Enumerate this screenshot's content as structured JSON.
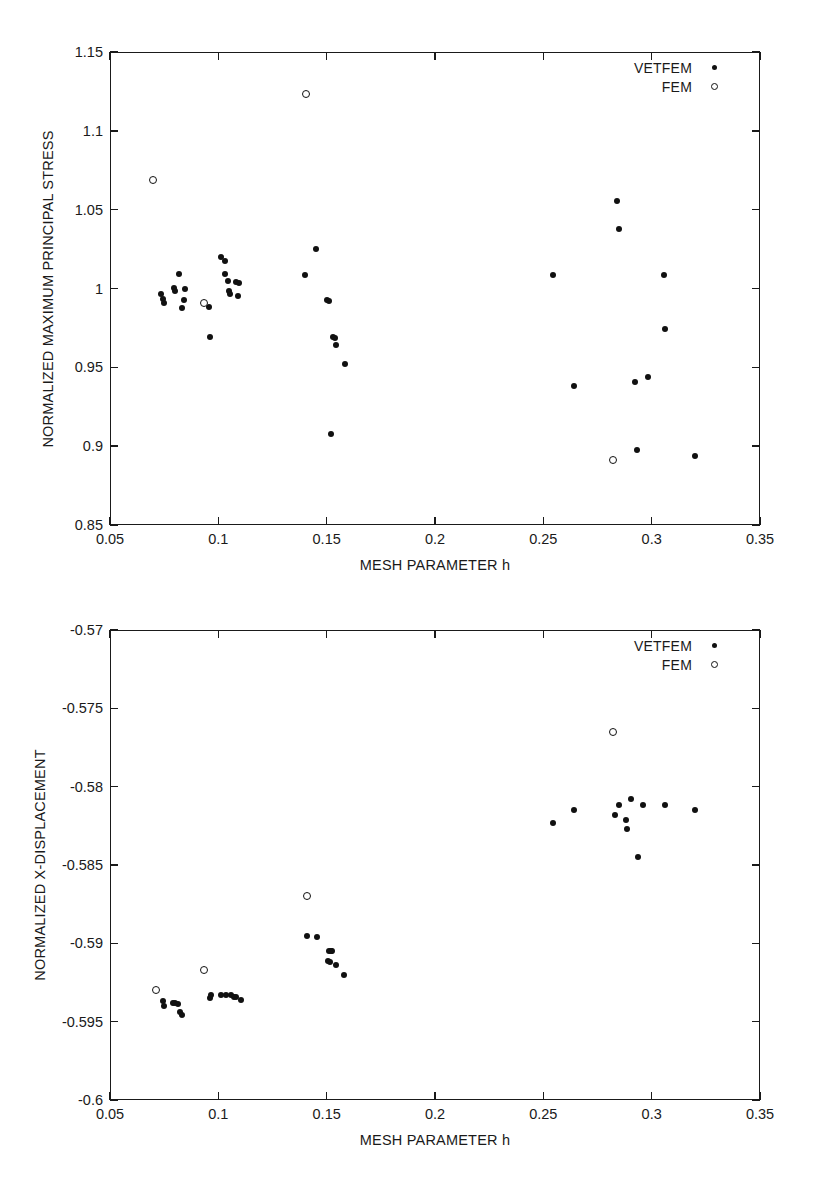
{
  "page": {
    "background": "#ffffff",
    "ink": "#111111"
  },
  "chart_data": [
    {
      "id": "stress",
      "type": "scatter",
      "title": "",
      "xlabel": "MESH PARAMETER h",
      "ylabel": "NORMALIZED MAXIMUM PRINCIPAL STRESS",
      "xlim": [
        0.05,
        0.35
      ],
      "ylim": [
        0.85,
        1.15
      ],
      "xticks": [
        0.05,
        0.1,
        0.15,
        0.2,
        0.25,
        0.3,
        0.35
      ],
      "xticklabels": [
        "0.05",
        "0.1",
        "0.15",
        "0.2",
        "0.25",
        "0.3",
        "0.35"
      ],
      "yticks": [
        0.85,
        0.9,
        0.95,
        1.0,
        1.05,
        1.1,
        1.15
      ],
      "yticklabels": [
        "0.85",
        "0.9",
        "0.95",
        "1",
        "1.05",
        "1.1",
        "1.15"
      ],
      "grid": false,
      "legend_position": "top-right",
      "legend": [
        {
          "name": "VETFEM",
          "marker": "filled-circle"
        },
        {
          "name": "FEM",
          "marker": "open-circle"
        }
      ],
      "series": [
        {
          "name": "VETFEM",
          "marker": "filled-circle",
          "points": [
            [
              0.0735,
              0.9965
            ],
            [
              0.0745,
              0.9935
            ],
            [
              0.075,
              0.9905
            ],
            [
              0.0795,
              1.0005
            ],
            [
              0.08,
              0.9985
            ],
            [
              0.082,
              1.0095
            ],
            [
              0.083,
              0.9875
            ],
            [
              0.084,
              0.9925
            ],
            [
              0.0845,
              0.9995
            ],
            [
              0.0955,
              0.9885
            ],
            [
              0.096,
              0.969
            ],
            [
              0.101,
              1.02
            ],
            [
              0.103,
              1.0175
            ],
            [
              0.103,
              1.009
            ],
            [
              0.1045,
              1.0045
            ],
            [
              0.105,
              0.9985
            ],
            [
              0.1055,
              0.9965
            ],
            [
              0.108,
              1.004
            ],
            [
              0.1095,
              1.0035
            ],
            [
              0.109,
              0.9955
            ],
            [
              0.14,
              1.0085
            ],
            [
              0.145,
              1.025
            ],
            [
              0.15,
              0.9925
            ],
            [
              0.151,
              0.992
            ],
            [
              0.152,
              0.908
            ],
            [
              0.153,
              0.969
            ],
            [
              0.154,
              0.9685
            ],
            [
              0.1545,
              0.964
            ],
            [
              0.1585,
              0.952
            ],
            [
              0.2545,
              1.0085
            ],
            [
              0.264,
              0.938
            ],
            [
              0.284,
              1.0555
            ],
            [
              0.285,
              1.0375
            ],
            [
              0.2925,
              0.9405
            ],
            [
              0.293,
              0.8975
            ],
            [
              0.2985,
              0.944
            ],
            [
              0.3055,
              1.0085
            ],
            [
              0.306,
              0.974
            ],
            [
              0.32,
              0.894
            ]
          ]
        },
        {
          "name": "FEM",
          "marker": "open-circle",
          "points": [
            [
              0.07,
              1.069
            ],
            [
              0.0935,
              0.9905
            ],
            [
              0.1405,
              1.1235
            ],
            [
              0.282,
              0.8915
            ]
          ]
        }
      ]
    },
    {
      "id": "displacement",
      "type": "scatter",
      "title": "",
      "xlabel": "MESH PARAMETER h",
      "ylabel": "NORMALIZED X-DISPLACEMENT",
      "xlim": [
        0.05,
        0.35
      ],
      "ylim": [
        -0.6,
        -0.57
      ],
      "xticks": [
        0.05,
        0.1,
        0.15,
        0.2,
        0.25,
        0.3,
        0.35
      ],
      "xticklabels": [
        "0.05",
        "0.1",
        "0.15",
        "0.2",
        "0.25",
        "0.3",
        "0.35"
      ],
      "yticks": [
        -0.6,
        -0.595,
        -0.59,
        -0.585,
        -0.58,
        -0.575,
        -0.57
      ],
      "yticklabels": [
        "-0.6",
        "-0.595",
        "-0.59",
        "-0.585",
        "-0.58",
        "-0.575",
        "-0.57"
      ],
      "grid": false,
      "legend_position": "top-right",
      "legend": [
        {
          "name": "VETFEM",
          "marker": "filled-circle"
        },
        {
          "name": "FEM",
          "marker": "open-circle"
        }
      ],
      "series": [
        {
          "name": "VETFEM",
          "marker": "filled-circle",
          "points": [
            [
              0.0745,
              -0.5937
            ],
            [
              0.075,
              -0.594
            ],
            [
              0.079,
              -0.5938
            ],
            [
              0.08,
              -0.5938
            ],
            [
              0.0815,
              -0.5939
            ],
            [
              0.0825,
              -0.5944
            ],
            [
              0.083,
              -0.5946
            ],
            [
              0.096,
              -0.5935
            ],
            [
              0.0965,
              -0.5933
            ],
            [
              0.101,
              -0.5933
            ],
            [
              0.1035,
              -0.5933
            ],
            [
              0.106,
              -0.5933
            ],
            [
              0.107,
              -0.5934
            ],
            [
              0.108,
              -0.5934
            ],
            [
              0.1105,
              -0.5936
            ],
            [
              0.141,
              -0.5895
            ],
            [
              0.1455,
              -0.5896
            ],
            [
              0.151,
              -0.5905
            ],
            [
              0.152,
              -0.5905
            ],
            [
              0.1525,
              -0.5905
            ],
            [
              0.1505,
              -0.5911
            ],
            [
              0.1515,
              -0.5912
            ],
            [
              0.1545,
              -0.5914
            ],
            [
              0.158,
              -0.592
            ],
            [
              0.2545,
              -0.5823
            ],
            [
              0.264,
              -0.5815
            ],
            [
              0.283,
              -0.5818
            ],
            [
              0.285,
              -0.5812
            ],
            [
              0.288,
              -0.5821
            ],
            [
              0.2885,
              -0.5827
            ],
            [
              0.2905,
              -0.5808
            ],
            [
              0.296,
              -0.5812
            ],
            [
              0.2935,
              -0.5845
            ],
            [
              0.306,
              -0.5812
            ],
            [
              0.32,
              -0.5815
            ]
          ]
        },
        {
          "name": "FEM",
          "marker": "open-circle",
          "points": [
            [
              0.071,
              -0.593
            ],
            [
              0.0935,
              -0.5917
            ],
            [
              0.141,
              -0.587
            ],
            [
              0.282,
              -0.5765
            ]
          ]
        }
      ]
    }
  ]
}
